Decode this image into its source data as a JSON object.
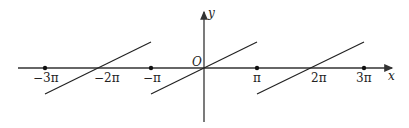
{
  "diagram": {
    "type": "function-graph",
    "axes": {
      "x_label": "x",
      "y_label": "y",
      "origin_label": "O"
    },
    "tick_labels": [
      "-3π",
      "-2π",
      "-π",
      "π",
      "2π",
      "3π"
    ],
    "marked_points": [
      "-3π",
      "-π",
      "π",
      "3π"
    ],
    "segments": [
      {
        "from": "-3π",
        "to": "-π",
        "crosses_axis_at": "-2π"
      },
      {
        "from": "-π",
        "to": "π",
        "crosses_axis_at": "0"
      },
      {
        "from": "π",
        "to": "3π",
        "crosses_axis_at": "2π"
      }
    ],
    "colors": {
      "line": "#222222",
      "axis": "#333333",
      "background": "#ffffff"
    }
  },
  "labels": {
    "neg3pi": "−3π",
    "neg2pi": "−2π",
    "negpi": "−π",
    "pi": "π",
    "twopi": "2π",
    "threepi": "3π",
    "x": "x",
    "y": "y",
    "origin": "O"
  }
}
